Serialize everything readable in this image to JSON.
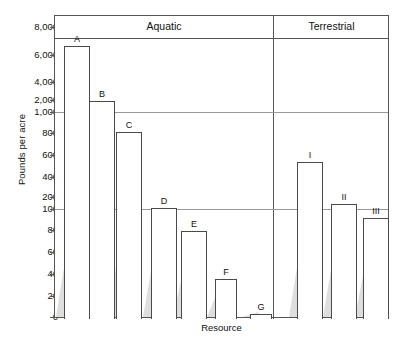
{
  "chart_data": {
    "type": "bar",
    "title": "",
    "xlabel": "Resource",
    "ylabel": "Pounds per acre",
    "scale": "segmented-log",
    "grid": false,
    "legend": false,
    "categories": [
      "A",
      "B",
      "C",
      "D",
      "E",
      "F",
      "G",
      "I",
      "II",
      "III"
    ],
    "values": [
      7000,
      2000,
      830,
      105,
      80,
      37,
      3,
      540,
      110,
      88
    ],
    "groups": [
      {
        "name": "Aquatic",
        "categories": [
          "A",
          "B",
          "C",
          "D",
          "E",
          "F",
          "G"
        ]
      },
      {
        "name": "Terrestrial",
        "categories": [
          "I",
          "II",
          "III"
        ]
      }
    ],
    "ytick_labels": [
      "8,000",
      "6,000",
      "4,000",
      "2,000",
      "1,000",
      "800",
      "600",
      "400",
      "200",
      "100",
      "80",
      "60",
      "40",
      "20",
      "0"
    ],
    "ytick_values": [
      8000,
      6000,
      4000,
      2000,
      1000,
      800,
      600,
      400,
      200,
      100,
      80,
      60,
      40,
      20,
      0
    ],
    "decade_breaks": [
      1000,
      100
    ],
    "ylim": [
      0,
      9000
    ]
  },
  "axes": {
    "y_title": "Pounds per acre",
    "x_title": "Resource"
  },
  "sections": {
    "aquatic": "Aquatic",
    "terrestrial": "Terrestrial"
  },
  "yticks": [
    {
      "label": "8,000",
      "y": 27
    },
    {
      "label": "6,000",
      "y": 55
    },
    {
      "label": "4,000",
      "y": 82
    },
    {
      "label": "2,000",
      "y": 100
    },
    {
      "label": "1,000",
      "y": 112
    },
    {
      "label": "800",
      "y": 133
    },
    {
      "label": "600",
      "y": 155
    },
    {
      "label": "400",
      "y": 177
    },
    {
      "label": "200",
      "y": 197
    },
    {
      "label": "100",
      "y": 209
    },
    {
      "label": "80",
      "y": 230
    },
    {
      "label": "60",
      "y": 252
    },
    {
      "label": "40",
      "y": 274
    },
    {
      "label": "20",
      "y": 296
    },
    {
      "label": "0",
      "y": 317
    }
  ],
  "bars": [
    {
      "label": "A",
      "value": 7000,
      "x": 63,
      "w": 26,
      "top": 45
    },
    {
      "label": "B",
      "value": 2000,
      "x": 88,
      "w": 26,
      "top": 100
    },
    {
      "label": "C",
      "value": 830,
      "x": 115,
      "w": 26,
      "top": 131
    },
    {
      "label": "D",
      "value": 105,
      "x": 150,
      "w": 26,
      "top": 207
    },
    {
      "label": "E",
      "value": 80,
      "x": 180,
      "w": 26,
      "top": 230
    },
    {
      "label": "F",
      "value": 37,
      "x": 214,
      "w": 22,
      "top": 278
    },
    {
      "label": "G",
      "value": 3,
      "x": 249,
      "w": 22,
      "top": 313
    },
    {
      "label": "I",
      "value": 540,
      "x": 296,
      "w": 26,
      "top": 161
    },
    {
      "label": "II",
      "value": 110,
      "x": 330,
      "w": 26,
      "top": 203
    },
    {
      "label": "III",
      "value": 88,
      "x": 362,
      "w": 26,
      "top": 217
    }
  ]
}
